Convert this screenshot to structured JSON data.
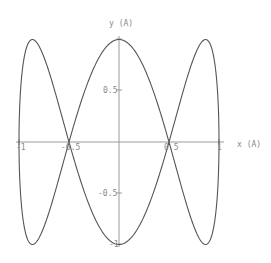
{
  "chart_data": {
    "type": "line",
    "title": "",
    "xlabel": "x (A)",
    "ylabel": "y (A)",
    "xlim": [
      -1,
      1
    ],
    "ylim": [
      -1,
      1
    ],
    "grid": false,
    "legend": null,
    "x_ticks": [
      "-1",
      "-0.5",
      "0.5",
      "1"
    ],
    "y_ticks": [
      "0.5",
      "-0.5",
      "-1"
    ],
    "series": [
      {
        "name": "parametric curve x=sin(t), y=cos(3t)",
        "parametric": {
          "x": "sin(t)",
          "y": "cos(3t)",
          "t_range": [
            0,
            6.2832
          ]
        },
        "key_points": [
          {
            "x": 0,
            "y": 1
          },
          {
            "x": 0.5,
            "y": 0
          },
          {
            "x": 0.866,
            "y": -1
          },
          {
            "x": 1,
            "y": 0
          },
          {
            "x": 0.866,
            "y": 1
          },
          {
            "x": 0.5,
            "y": 0
          },
          {
            "x": 0,
            "y": -1
          },
          {
            "x": -0.5,
            "y": 0
          },
          {
            "x": -0.866,
            "y": 1
          },
          {
            "x": -1,
            "y": 0
          },
          {
            "x": -0.866,
            "y": -1
          },
          {
            "x": -0.5,
            "y": 0
          }
        ]
      }
    ]
  },
  "labels": {
    "xaxis": "x (A)",
    "yaxis": "y (A)",
    "xtick_m1": "-1",
    "xtick_m05": "-0.5",
    "xtick_05": "0.5",
    "xtick_1": "1",
    "ytick_05": "0.5",
    "ytick_m05": "-0.5",
    "ytick_m1": "-1"
  }
}
